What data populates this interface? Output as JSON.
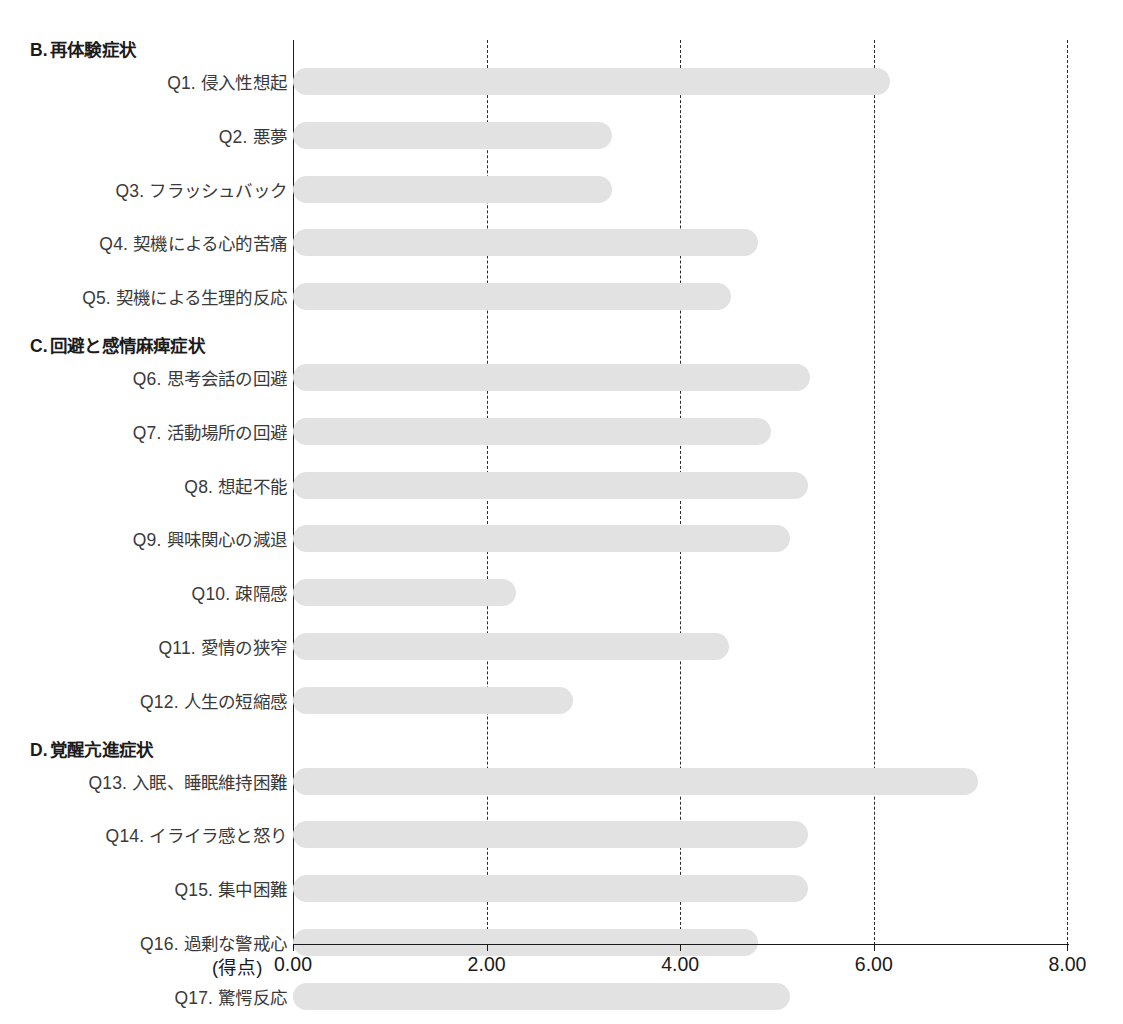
{
  "chart_data": {
    "type": "bar",
    "orientation": "horizontal",
    "title": "",
    "xlabel": "(得点)",
    "ylabel": "",
    "xlim": [
      0.0,
      8.0
    ],
    "xticks": [
      0.0,
      2.0,
      4.0,
      6.0,
      8.0
    ],
    "xtick_labels": [
      "0.00",
      "2.00",
      "4.00",
      "6.00",
      "8.00"
    ],
    "grid": "dashed vertical gridlines at 2.00, 4.00, 6.00, 8.00",
    "legend": "none",
    "bar_color": "#e2e2e2",
    "axis_color": "#1a1a1a",
    "sections": [
      {
        "letter": "B.",
        "title": "再体験症状",
        "items": [
          {
            "label": "Q1. 侵入性想起",
            "value": 6.17
          },
          {
            "label": "Q2. 悪夢",
            "value": 3.3
          },
          {
            "label": "Q3. フラッシュバック",
            "value": 3.3
          },
          {
            "label": "Q4. 契機による心的苦痛",
            "value": 4.8
          },
          {
            "label": "Q5. 契機による生理的反応",
            "value": 4.52
          }
        ]
      },
      {
        "letter": "C.",
        "title": "回避と感情麻痺症状",
        "items": [
          {
            "label": "Q6. 思考会話の回避",
            "value": 5.34
          },
          {
            "label": "Q7. 活動場所の回避",
            "value": 4.94
          },
          {
            "label": "Q8. 想起不能",
            "value": 5.32
          },
          {
            "label": "Q9. 興味関心の減退",
            "value": 5.13
          },
          {
            "label": "Q10. 疎隔感",
            "value": 2.3
          },
          {
            "label": "Q11. 愛情の狭窄",
            "value": 4.5
          },
          {
            "label": "Q12. 人生の短縮感",
            "value": 2.89
          }
        ]
      },
      {
        "letter": "D.",
        "title": "覚醒亢進症状",
        "items": [
          {
            "label": "Q13. 入眠、睡眠維持困難",
            "value": 7.08
          },
          {
            "label": "Q14. イライラ感と怒り",
            "value": 5.32
          },
          {
            "label": "Q15. 集中困難",
            "value": 5.32
          },
          {
            "label": "Q16. 過剰な警戒心",
            "value": 4.8
          },
          {
            "label": "Q17. 驚愕反応",
            "value": 5.13
          }
        ]
      }
    ],
    "categories": [
      "Q1. 侵入性想起",
      "Q2. 悪夢",
      "Q3. フラッシュバック",
      "Q4. 契機による心的苦痛",
      "Q5. 契機による生理的反応",
      "Q6. 思考会話の回避",
      "Q7. 活動場所の回避",
      "Q8. 想起不能",
      "Q9. 興味関心の減退",
      "Q10. 疎隔感",
      "Q11. 愛情の狭窄",
      "Q12. 人生の短縮感",
      "Q13. 入眠、睡眠維持困難",
      "Q14. イライラ感と怒り",
      "Q15. 集中困難",
      "Q16. 過剰な警戒心",
      "Q17. 驚愕反応"
    ],
    "values": [
      6.17,
      3.3,
      3.3,
      4.8,
      4.52,
      5.34,
      4.94,
      5.32,
      5.13,
      2.3,
      4.5,
      2.89,
      7.08,
      5.32,
      5.32,
      4.8,
      5.13
    ]
  }
}
